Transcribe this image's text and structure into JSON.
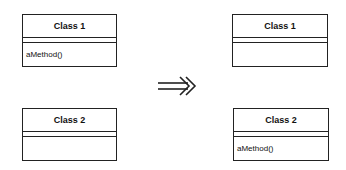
{
  "before": {
    "classes": [
      {
        "name": "Class 1",
        "attributes": [],
        "methods": [
          "aMethod()"
        ]
      },
      {
        "name": "Class 2",
        "attributes": [],
        "methods": []
      }
    ]
  },
  "transition": {
    "icon": "double-arrow-right-icon"
  },
  "after": {
    "classes": [
      {
        "name": "Class 1",
        "attributes": [],
        "methods": []
      },
      {
        "name": "Class 2",
        "attributes": [],
        "methods": [
          "aMethod()"
        ]
      }
    ]
  },
  "colors": {
    "line": "#222222",
    "text": "#111111",
    "background": "#ffffff"
  }
}
